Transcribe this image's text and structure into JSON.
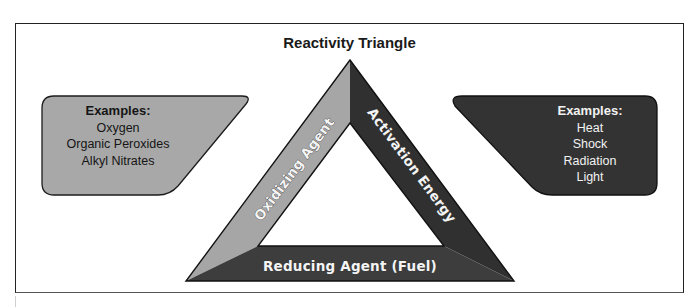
{
  "title": "Reactivity Triangle",
  "colors": {
    "oxidizing_strip": "#a6a6a6",
    "activation_strip": "#303030",
    "reducing_strip": "#3d3d3d",
    "left_box": "#a8a8a8",
    "right_box": "#333333",
    "frame": "#222222"
  },
  "triangle": {
    "sides": [
      {
        "id": "left",
        "label": "Oxidizing Agent"
      },
      {
        "id": "right",
        "label": "Activation Energy"
      },
      {
        "id": "bottom",
        "label": "Reducing Agent (Fuel)"
      }
    ]
  },
  "left_box": {
    "heading": "Examples:",
    "items": [
      "Oxygen",
      "Organic Peroxides",
      "Alkyl Nitrates"
    ]
  },
  "right_box": {
    "heading": "Examples:",
    "items": [
      "Heat",
      "Shock",
      "Radiation",
      "Light"
    ]
  }
}
